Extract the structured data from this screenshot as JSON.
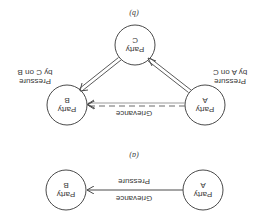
{
  "figure": {
    "orientation": "rotated 180 degrees",
    "panel_a": {
      "caption": "(a)",
      "nodes": [
        {
          "id": "A",
          "line1": "Party",
          "line2": "A"
        },
        {
          "id": "B",
          "line1": "Party",
          "line2": "B"
        }
      ],
      "edge": {
        "from": "A",
        "to": "B",
        "label_top": "Grievance",
        "label_bottom": "Pressure"
      }
    },
    "panel_b": {
      "caption": "(b)",
      "nodes": [
        {
          "id": "A",
          "line1": "Party",
          "line2": "A"
        },
        {
          "id": "B",
          "line1": "Party",
          "line2": "B"
        },
        {
          "id": "C",
          "line1": "Party",
          "line2": "C"
        }
      ],
      "edges": [
        {
          "from": "A",
          "to": "B",
          "style": "dashed-double",
          "label": "Grievance"
        },
        {
          "from": "A",
          "to": "C",
          "style": "double",
          "label_line1": "Pressure",
          "label_line2": "by A on C"
        },
        {
          "from": "C",
          "to": "B",
          "style": "double",
          "label_line1": "Pressure",
          "label_line2": "by C on B"
        }
      ]
    },
    "colors": {
      "stroke": "#4a4a4a",
      "text": "#3a3a3a",
      "background": "#ffffff"
    }
  }
}
